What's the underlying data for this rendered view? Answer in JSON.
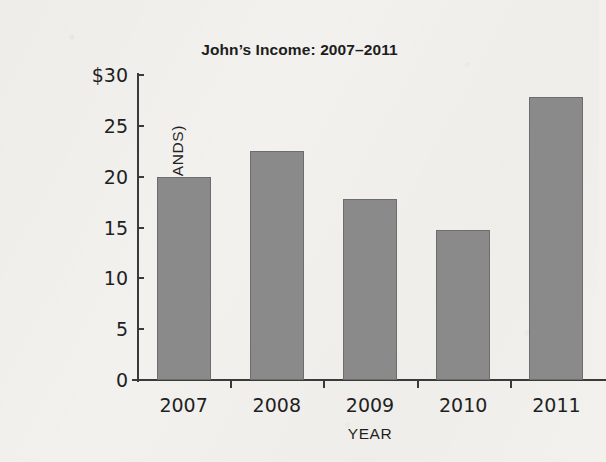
{
  "chart_data": {
    "type": "bar",
    "title": "John’s Income: 2007–2011",
    "xlabel": "YEAR",
    "ylabel": "INCOME (IN THOUSANDS)",
    "categories": [
      "2007",
      "2008",
      "2009",
      "2010",
      "2011"
    ],
    "values": [
      20,
      22.5,
      17.8,
      14.8,
      27.8
    ],
    "ylim": [
      0,
      30
    ],
    "ytick_values": [
      0,
      5,
      10,
      15,
      20,
      25,
      30
    ],
    "ytick_labels": [
      "0",
      "5",
      "10",
      "15",
      "20",
      "25",
      "$30"
    ],
    "grid": false,
    "legend": false,
    "bar_color": "#8a8a8a",
    "bar_edge_color": "#6d6d6d",
    "axis_color": "#3a3a3a",
    "background_color": "#f2f1ee",
    "text_color": "#1f1f1f"
  }
}
